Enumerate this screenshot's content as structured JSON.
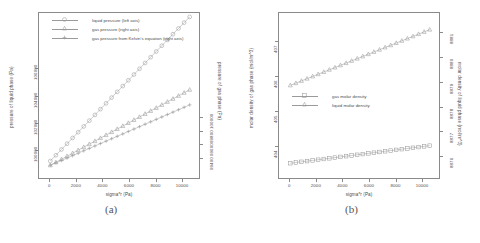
{
  "figure": {
    "caption_a": "(a)",
    "caption_b": "(b)"
  },
  "chart_data": [
    {
      "type": "line",
      "panel": "a",
      "title": "",
      "xlabel": "sigma*r (Pa)",
      "ylabel_left": "pressure of liquid phase (Pa)",
      "ylabel_right": "pressure of gas phase (Pa)",
      "xlim": [
        -400,
        10900
      ],
      "xticks": [
        0,
        2000,
        4000,
        6000,
        8000,
        10000
      ],
      "xticklabels": [
        "0",
        "2000",
        "4000",
        "6000",
        "8000",
        "10000"
      ],
      "ylim_left": [
        98500,
        109500
      ],
      "yticks_left": [
        100000,
        102000,
        104000,
        106000
      ],
      "yticklabels_left": [
        "100000",
        "102000",
        "104000",
        "106000"
      ],
      "ylim_right": [
        99200,
        101450
      ],
      "yticks_right": [
        99400,
        99600,
        99800,
        100000
      ],
      "yticklabels_right": [
        "99400",
        "99600",
        "99800",
        "100000"
      ],
      "grid": false,
      "legend_position": "top-left",
      "x": [
        0,
        420,
        840,
        1260,
        1680,
        2100,
        2520,
        2940,
        3360,
        3780,
        4200,
        4620,
        5040,
        5460,
        5880,
        6300,
        6720,
        7140,
        7560,
        7980,
        8400,
        8820,
        9240,
        9660,
        10080,
        10500
      ],
      "series": [
        {
          "name": "liquid pressure (left axis)",
          "axis": "left",
          "symbol": "circle",
          "values": [
            99300,
            99720,
            100140,
            100560,
            100980,
            101400,
            101820,
            102240,
            102660,
            103080,
            103500,
            103920,
            104340,
            104760,
            105180,
            105600,
            106020,
            106440,
            106860,
            107280,
            107700,
            108120,
            108540,
            108960,
            109380,
            109800
          ]
        },
        {
          "name": "gas pressure (right axis)",
          "axis": "right",
          "symbol": "triangle",
          "values": [
            99300,
            99345,
            99390,
            99435,
            99480,
            99525,
            99570,
            99615,
            99660,
            99705,
            99750,
            99795,
            99840,
            99885,
            99930,
            99975,
            100020,
            100065,
            100110,
            100155,
            100200,
            100245,
            100290,
            100335,
            100380,
            100425
          ]
        },
        {
          "name": "gas pressure from Kelvin's equation (right axis)",
          "axis": "right",
          "symbol": "plus",
          "values": [
            99300,
            99336,
            99372,
            99408,
            99444,
            99480,
            99516,
            99552,
            99588,
            99624,
            99660,
            99696,
            99732,
            99768,
            99804,
            99840,
            99876,
            99912,
            99948,
            99984,
            100020,
            100056,
            100092,
            100128,
            100164,
            100200
          ]
        }
      ]
    },
    {
      "type": "line",
      "panel": "b",
      "title": "",
      "xlabel": "sigma*r (Pa)",
      "ylabel_left": "molar density of gas phase (mol/m^3)",
      "ylabel_right": "molar density of liquid phase (mol/m^3)",
      "xlim": [
        -400,
        10900
      ],
      "xticks": [
        0,
        2000,
        4000,
        6000,
        8000,
        10000
      ],
      "xticklabels": [
        "0",
        "2000",
        "4000",
        "6000",
        "8000",
        "10000"
      ],
      "ylim_left": [
        403.3,
        407.6
      ],
      "yticks_left": [
        404,
        405,
        406,
        407
      ],
      "yticklabels_left": [
        "404",
        "405",
        "406",
        "407"
      ],
      "ylim_right": [
        8875.4,
        8881.5
      ],
      "yticks_right": [
        8876,
        8877,
        8878,
        8879,
        8880,
        8881
      ],
      "yticklabels_right": [
        "8876",
        "8877",
        "8878",
        "8879",
        "8880",
        "8881"
      ],
      "grid": false,
      "legend_position": "middle-left",
      "x": [
        0,
        420,
        840,
        1260,
        1680,
        2100,
        2520,
        2940,
        3360,
        3780,
        4200,
        4620,
        5040,
        5460,
        5880,
        6300,
        6720,
        7140,
        7560,
        7980,
        8400,
        8820,
        9240,
        9660,
        10080,
        10500
      ],
      "series": [
        {
          "name": "gas molar density",
          "axis": "left",
          "symbol": "square",
          "values": [
            403.55,
            403.57,
            403.59,
            403.61,
            403.63,
            403.65,
            403.67,
            403.69,
            403.71,
            403.73,
            403.75,
            403.77,
            403.79,
            403.81,
            403.83,
            403.85,
            403.87,
            403.89,
            403.91,
            403.93,
            403.95,
            403.97,
            403.99,
            404.01,
            404.03,
            404.05
          ]
        },
        {
          "name": "liquid molar density",
          "axis": "right",
          "symbol": "triangle",
          "values": [
            8878.9,
            8878.99,
            8879.08,
            8879.17,
            8879.26,
            8879.35,
            8879.44,
            8879.53,
            8879.62,
            8879.71,
            8879.8,
            8879.89,
            8879.98,
            8880.07,
            8880.16,
            8880.25,
            8880.34,
            8880.43,
            8880.52,
            8880.61,
            8880.7,
            8880.79,
            8880.88,
            8880.97,
            8881.06,
            8881.15
          ]
        }
      ]
    }
  ]
}
